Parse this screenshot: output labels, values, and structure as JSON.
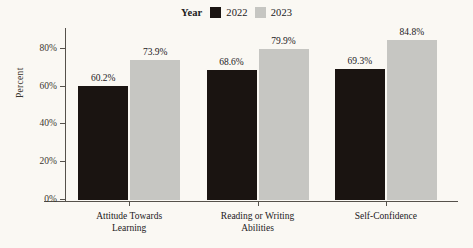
{
  "legend": {
    "title": "Year",
    "items": [
      {
        "label": "2022",
        "color": "#1a1411"
      },
      {
        "label": "2023",
        "color": "#c6c6c2"
      }
    ]
  },
  "axes": {
    "y_title": "Percent",
    "y_ticks": [
      "0%",
      "20%",
      "40%",
      "60%",
      "80%"
    ],
    "y_tick_values": [
      0,
      20,
      40,
      60,
      80
    ]
  },
  "chart_data": {
    "type": "bar",
    "title": "",
    "subtitle": "",
    "xlabel": "",
    "ylabel": "Percent",
    "ylim": [
      0,
      90
    ],
    "grid": false,
    "legend_position": "top-center",
    "legend_title": "Year",
    "categories": [
      "Attitude Towards\nLearning",
      "Reading or Writing\nAbilities",
      "Self-Confidence"
    ],
    "series": [
      {
        "name": "2022",
        "color": "#1a1411",
        "values": [
          60.2,
          68.6,
          69.3
        ],
        "labels": [
          "60.2%",
          "68.6%",
          "69.3%"
        ]
      },
      {
        "name": "2023",
        "color": "#c6c6c2",
        "values": [
          73.9,
          79.9,
          84.8
        ],
        "labels": [
          "73.9%",
          "79.9%",
          "84.8%"
        ]
      }
    ]
  }
}
